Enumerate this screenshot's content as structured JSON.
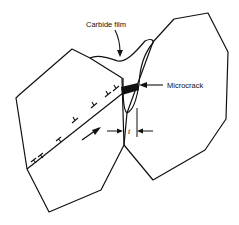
{
  "figure": {
    "labels": {
      "carbide_film": "Carbide film",
      "microcrack": "Microcrack",
      "thickness": "t"
    },
    "elements": {
      "grains": [
        "left-grain",
        "right-grain"
      ],
      "slip_band": "dislocation pile-up along slip plane",
      "dislocation_symbol": "⊥",
      "dislocation_count": 8,
      "shear_arrow": "slip direction"
    },
    "colors": {
      "line": "#111111",
      "background": "#ffffff"
    }
  }
}
